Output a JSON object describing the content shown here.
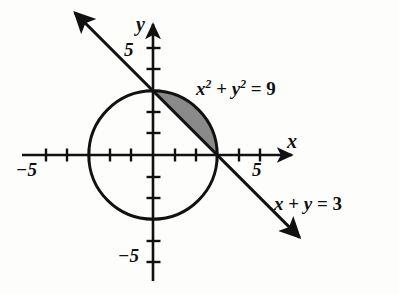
{
  "figure": {
    "background_color": "#fdfdfc",
    "ink_color": "#111111",
    "shade_color": "#8a8a8a"
  },
  "axes": {
    "x_axis_name": "x",
    "y_axis_name": "y",
    "x_ticks_labeled": [
      {
        "value": -5,
        "label": "−5"
      },
      {
        "value": 5,
        "label": "5"
      }
    ],
    "y_ticks_labeled": [
      {
        "value": 5,
        "label": "5"
      },
      {
        "value": -5,
        "label": "−5"
      }
    ],
    "xlim": [
      -6.3,
      6.5
    ],
    "ylim": [
      -6.1,
      6.1
    ],
    "tick_values": [
      -5,
      -4,
      -3,
      -2,
      -1,
      1,
      2,
      3,
      4,
      5
    ],
    "grid": false,
    "origin_px": {
      "x": 153,
      "y": 155
    },
    "unit_px": 21.4
  },
  "chart_data": {
    "type": "line",
    "title": "",
    "xlabel": "x",
    "ylabel": "y",
    "xlim": [
      -6.3,
      6.5
    ],
    "ylim": [
      -6.1,
      6.1
    ],
    "grid": false,
    "legend": "none",
    "series": [
      {
        "name": "circle",
        "equation": "x^2 + y^2 = 9",
        "label": "x² + y² = 9",
        "type": "circle",
        "center": [
          0,
          0
        ],
        "radius": 3,
        "style": "solid-black"
      },
      {
        "name": "line",
        "equation": "x + y = 3",
        "label": "x + y = 3",
        "type": "line",
        "slope": -1,
        "intercept": 3,
        "x_intercept": 3,
        "y_intercept": 3,
        "arrow_start": [
          -3.65,
          6.65
        ],
        "arrow_end": [
          6.85,
          -3.85
        ],
        "style": "solid-black-double-arrow"
      }
    ],
    "annotations": [
      {
        "name": "shaded-segment",
        "description": "Circular segment between chord x + y = 3 and arc of circle x^2 + y^2 = 9 in the first quadrant",
        "vertices": [
          [
            0,
            3
          ],
          [
            3,
            0
          ]
        ],
        "fill": "#8a8a8a"
      }
    ]
  },
  "labels": {
    "circle_equation_prefix": "x",
    "circle_equation": "x² + y² = 9",
    "line_equation": "x + y = 3",
    "x_axis": "x",
    "y_axis": "y",
    "x_pos_five": "5",
    "x_neg_five": "−5",
    "y_pos_five": "5",
    "y_neg_five": "−5"
  }
}
